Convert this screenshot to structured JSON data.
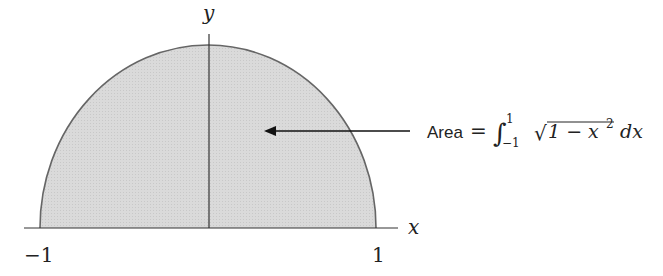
{
  "diagram": {
    "axes": {
      "x_label": "x",
      "y_label": "y"
    },
    "ticks": {
      "left": "−1",
      "right": "1"
    },
    "annotation": {
      "prefix": "Area",
      "equals": "=",
      "integral": "∫",
      "lower": "−1",
      "upper": "1",
      "sqrt": "√",
      "radicand": "1 − x",
      "exp": "2",
      "dx": "dx"
    },
    "colors": {
      "fill": "#d9d9d9",
      "stroke": "#555555",
      "axis": "#333333"
    }
  }
}
